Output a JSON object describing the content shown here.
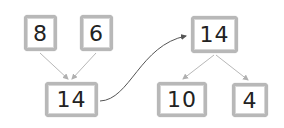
{
  "diagram": {
    "left": {
      "top_boxes": [
        {
          "value": "8"
        },
        {
          "value": "6"
        }
      ],
      "result_box": {
        "value": "14"
      }
    },
    "right": {
      "top_box": {
        "value": "14"
      },
      "bottom_boxes": [
        {
          "value": "10"
        },
        {
          "value": "4"
        }
      ]
    },
    "colors": {
      "box_border": "#b8b8b8",
      "arrow": "#b0b0b0",
      "curve": "#555555",
      "text": "#222222"
    }
  }
}
